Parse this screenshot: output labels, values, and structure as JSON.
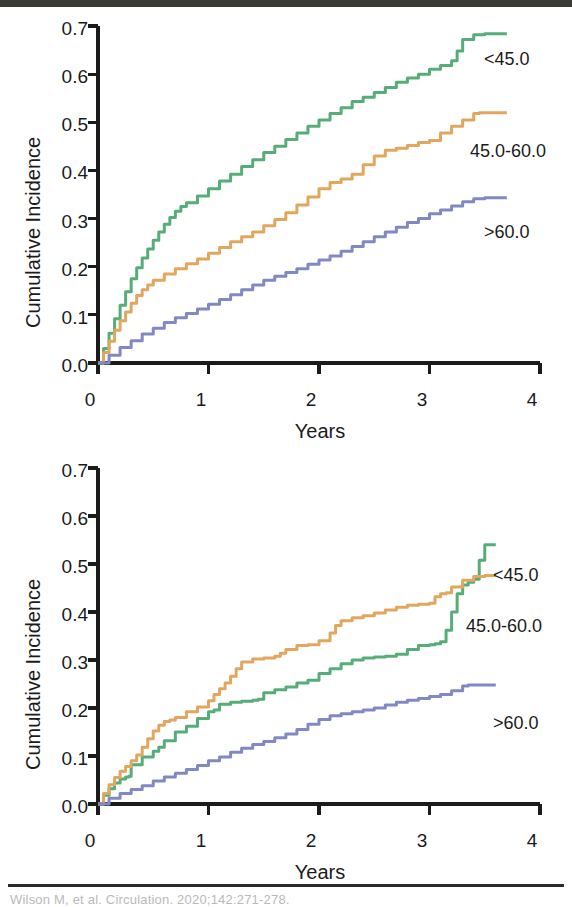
{
  "figure": {
    "caption": "Wilson M, et al. Circulation. 2020;142:271-278.",
    "panel_count": 2
  },
  "colors": {
    "series_lt45": "#56ad78",
    "series_45_60": "#e2a75e",
    "series_gt60": "#8189c4",
    "axis": "#1b1b1b",
    "text": "#1b1b1b",
    "background": "#ffffff",
    "scan_bar": "#3b3b36",
    "caption_rule": "#2a2a2a"
  },
  "axes": {
    "ylabel": "Cumulative Incidence",
    "xlabel": "Years",
    "yticks": [
      "0.0",
      "0.1",
      "0.2",
      "0.3",
      "0.4",
      "0.5",
      "0.6",
      "0.7"
    ],
    "xticks": [
      "0",
      "1",
      "2",
      "3",
      "4"
    ],
    "ylim": [
      0.0,
      0.7
    ],
    "xlim": [
      0,
      4
    ]
  },
  "legend": {
    "lt45": "<45.0",
    "mid": "45.0-60.0",
    "gt60": ">60.0"
  },
  "chart_data": [
    {
      "type": "line",
      "panel": "top",
      "title": "",
      "xlabel": "Years",
      "ylabel": "Cumulative Incidence",
      "xlim": [
        0,
        4
      ],
      "ylim": [
        0.0,
        0.7
      ],
      "grid": false,
      "legend_position": "right-inline",
      "step": true,
      "series": [
        {
          "name": "<45.0",
          "color": "#56ad78",
          "x": [
            0.0,
            0.05,
            0.1,
            0.15,
            0.2,
            0.25,
            0.3,
            0.35,
            0.4,
            0.45,
            0.5,
            0.55,
            0.6,
            0.65,
            0.7,
            0.75,
            0.8,
            0.9,
            1.0,
            1.1,
            1.2,
            1.3,
            1.4,
            1.5,
            1.6,
            1.7,
            1.8,
            1.9,
            2.0,
            2.1,
            2.2,
            2.3,
            2.4,
            2.5,
            2.6,
            2.7,
            2.8,
            2.9,
            3.0,
            3.1,
            3.2,
            3.25,
            3.3,
            3.4,
            3.5,
            3.6,
            3.7
          ],
          "y": [
            0.0,
            0.03,
            0.062,
            0.092,
            0.12,
            0.148,
            0.175,
            0.198,
            0.218,
            0.237,
            0.255,
            0.272,
            0.288,
            0.302,
            0.315,
            0.325,
            0.333,
            0.347,
            0.362,
            0.378,
            0.392,
            0.408,
            0.422,
            0.437,
            0.45,
            0.464,
            0.478,
            0.492,
            0.505,
            0.518,
            0.53,
            0.543,
            0.552,
            0.562,
            0.572,
            0.583,
            0.592,
            0.6,
            0.61,
            0.618,
            0.628,
            0.648,
            0.672,
            0.682,
            0.684,
            0.684,
            0.684
          ]
        },
        {
          "name": "45.0-60.0",
          "color": "#e2a75e",
          "x": [
            0.0,
            0.05,
            0.1,
            0.15,
            0.2,
            0.25,
            0.3,
            0.35,
            0.4,
            0.45,
            0.5,
            0.6,
            0.7,
            0.8,
            0.9,
            1.0,
            1.1,
            1.2,
            1.3,
            1.4,
            1.5,
            1.6,
            1.7,
            1.8,
            1.9,
            2.0,
            2.1,
            2.2,
            2.3,
            2.4,
            2.5,
            2.6,
            2.7,
            2.8,
            2.9,
            3.0,
            3.1,
            3.2,
            3.3,
            3.4,
            3.45,
            3.55,
            3.7
          ],
          "y": [
            0.0,
            0.022,
            0.045,
            0.068,
            0.088,
            0.106,
            0.124,
            0.14,
            0.152,
            0.162,
            0.172,
            0.185,
            0.196,
            0.206,
            0.216,
            0.228,
            0.24,
            0.252,
            0.262,
            0.272,
            0.285,
            0.298,
            0.312,
            0.328,
            0.345,
            0.362,
            0.375,
            0.382,
            0.392,
            0.412,
            0.43,
            0.442,
            0.446,
            0.452,
            0.458,
            0.462,
            0.478,
            0.492,
            0.505,
            0.518,
            0.52,
            0.52,
            0.52
          ]
        },
        {
          "name": ">60.0",
          "color": "#8189c4",
          "x": [
            0.0,
            0.1,
            0.2,
            0.3,
            0.4,
            0.5,
            0.6,
            0.7,
            0.8,
            0.9,
            1.0,
            1.1,
            1.2,
            1.3,
            1.4,
            1.5,
            1.6,
            1.7,
            1.8,
            1.9,
            2.0,
            2.1,
            2.2,
            2.3,
            2.4,
            2.5,
            2.6,
            2.7,
            2.8,
            2.9,
            3.0,
            3.1,
            3.2,
            3.3,
            3.4,
            3.5,
            3.6,
            3.7
          ],
          "y": [
            0.0,
            0.016,
            0.032,
            0.046,
            0.06,
            0.072,
            0.084,
            0.094,
            0.103,
            0.112,
            0.122,
            0.132,
            0.142,
            0.152,
            0.162,
            0.172,
            0.18,
            0.188,
            0.196,
            0.205,
            0.214,
            0.222,
            0.232,
            0.242,
            0.252,
            0.262,
            0.272,
            0.282,
            0.292,
            0.3,
            0.31,
            0.318,
            0.326,
            0.335,
            0.341,
            0.343,
            0.343,
            0.343
          ]
        }
      ]
    },
    {
      "type": "line",
      "panel": "bottom",
      "title": "",
      "xlabel": "Years",
      "ylabel": "Cumulative Incidence",
      "xlim": [
        0,
        4
      ],
      "ylim": [
        0.0,
        0.7
      ],
      "grid": false,
      "legend_position": "right-inline",
      "step": true,
      "series": [
        {
          "name": "<45.0",
          "color": "#56ad78",
          "x": [
            0.0,
            0.05,
            0.1,
            0.15,
            0.2,
            0.25,
            0.28,
            0.3,
            0.4,
            0.5,
            0.55,
            0.6,
            0.7,
            0.8,
            0.9,
            1.0,
            1.05,
            1.1,
            1.2,
            1.3,
            1.4,
            1.45,
            1.5,
            1.6,
            1.7,
            1.8,
            1.9,
            2.0,
            2.1,
            2.2,
            2.3,
            2.4,
            2.5,
            2.6,
            2.7,
            2.8,
            2.9,
            3.0,
            3.05,
            3.1,
            3.15,
            3.2,
            3.25,
            3.3,
            3.35,
            3.4,
            3.45,
            3.5,
            3.6
          ],
          "y": [
            0.0,
            0.018,
            0.032,
            0.044,
            0.052,
            0.056,
            0.058,
            0.082,
            0.098,
            0.11,
            0.118,
            0.132,
            0.15,
            0.162,
            0.178,
            0.192,
            0.196,
            0.208,
            0.212,
            0.214,
            0.216,
            0.218,
            0.232,
            0.238,
            0.244,
            0.252,
            0.258,
            0.272,
            0.282,
            0.292,
            0.3,
            0.304,
            0.306,
            0.308,
            0.312,
            0.322,
            0.33,
            0.332,
            0.334,
            0.338,
            0.362,
            0.4,
            0.438,
            0.456,
            0.462,
            0.468,
            0.508,
            0.54,
            0.54
          ]
        },
        {
          "name": "45.0-60.0",
          "color": "#e2a75e",
          "x": [
            0.0,
            0.05,
            0.1,
            0.15,
            0.2,
            0.25,
            0.3,
            0.35,
            0.4,
            0.45,
            0.5,
            0.55,
            0.6,
            0.65,
            0.7,
            0.8,
            0.9,
            1.0,
            1.05,
            1.1,
            1.15,
            1.2,
            1.25,
            1.3,
            1.4,
            1.5,
            1.6,
            1.65,
            1.7,
            1.8,
            1.9,
            2.0,
            2.1,
            2.15,
            2.2,
            2.3,
            2.4,
            2.5,
            2.6,
            2.7,
            2.8,
            2.9,
            3.0,
            3.05,
            3.1,
            3.15,
            3.2,
            3.3,
            3.4,
            3.5,
            3.6
          ],
          "y": [
            0.0,
            0.022,
            0.04,
            0.055,
            0.068,
            0.078,
            0.09,
            0.102,
            0.118,
            0.136,
            0.152,
            0.164,
            0.172,
            0.175,
            0.18,
            0.192,
            0.202,
            0.215,
            0.228,
            0.24,
            0.252,
            0.266,
            0.282,
            0.296,
            0.302,
            0.304,
            0.308,
            0.314,
            0.322,
            0.33,
            0.332,
            0.34,
            0.356,
            0.372,
            0.382,
            0.388,
            0.392,
            0.398,
            0.404,
            0.41,
            0.414,
            0.416,
            0.418,
            0.432,
            0.438,
            0.44,
            0.452,
            0.466,
            0.474,
            0.476,
            0.476
          ]
        },
        {
          "name": ">60.0",
          "color": "#8189c4",
          "x": [
            0.0,
            0.1,
            0.2,
            0.3,
            0.4,
            0.5,
            0.6,
            0.7,
            0.8,
            0.9,
            1.0,
            1.1,
            1.2,
            1.3,
            1.4,
            1.5,
            1.6,
            1.7,
            1.8,
            1.9,
            2.0,
            2.1,
            2.2,
            2.3,
            2.4,
            2.5,
            2.6,
            2.7,
            2.8,
            2.9,
            3.0,
            3.1,
            3.2,
            3.3,
            3.35,
            3.45,
            3.6
          ],
          "y": [
            0.0,
            0.012,
            0.022,
            0.03,
            0.038,
            0.048,
            0.056,
            0.064,
            0.072,
            0.08,
            0.09,
            0.098,
            0.108,
            0.116,
            0.124,
            0.13,
            0.138,
            0.146,
            0.155,
            0.166,
            0.176,
            0.184,
            0.188,
            0.192,
            0.196,
            0.2,
            0.206,
            0.212,
            0.216,
            0.22,
            0.224,
            0.228,
            0.236,
            0.246,
            0.248,
            0.248,
            0.248
          ]
        }
      ]
    }
  ]
}
